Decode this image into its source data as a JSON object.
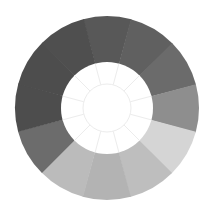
{
  "diagram": {
    "type": "segmented-ring",
    "title": "",
    "center": [
      107,
      108
    ],
    "outer_radius": 92,
    "inner_radius": 46,
    "inner_ring_radius": 24,
    "segment_count": 12,
    "start_angle_deg": -15,
    "segments": [
      {
        "index": 0,
        "angle_center_deg": 0,
        "color": "#585858"
      },
      {
        "index": 1,
        "angle_center_deg": 30,
        "color": "#606060"
      },
      {
        "index": 2,
        "angle_center_deg": 60,
        "color": "#6b6b6b"
      },
      {
        "index": 3,
        "angle_center_deg": 90,
        "color": "#8e8e8e"
      },
      {
        "index": 4,
        "angle_center_deg": 120,
        "color": "#d5d5d5"
      },
      {
        "index": 5,
        "angle_center_deg": 150,
        "color": "#bebebe"
      },
      {
        "index": 6,
        "angle_center_deg": 180,
        "color": "#b3b3b3"
      },
      {
        "index": 7,
        "angle_center_deg": 210,
        "color": "#bbbbbb"
      },
      {
        "index": 8,
        "angle_center_deg": 240,
        "color": "#6c6c6c"
      },
      {
        "index": 9,
        "angle_center_deg": 270,
        "color": "#4d4d4d"
      },
      {
        "index": 10,
        "angle_center_deg": 300,
        "color": "#4d4d4d"
      },
      {
        "index": 11,
        "angle_center_deg": 330,
        "color": "#4f4f4f"
      }
    ],
    "spoke_color": "#ececec",
    "background": "#ffffff"
  }
}
